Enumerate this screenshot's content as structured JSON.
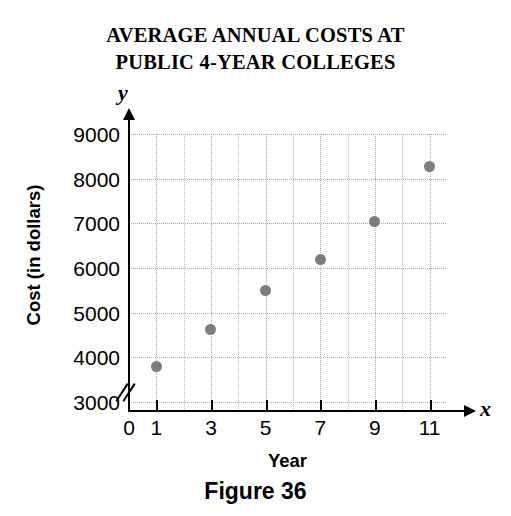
{
  "figure": {
    "title_line_1": "AVERAGE ANNUAL COSTS AT",
    "title_line_2": "PUBLIC 4-YEAR COLLEGES",
    "caption": "Figure 36"
  },
  "axes": {
    "y_variable_letter": "y",
    "x_variable_letter": "x",
    "y_title": "Cost (in dollars)",
    "x_title": "Year",
    "y_tick_labels": [
      "9000",
      "8000",
      "7000",
      "6000",
      "5000",
      "4000",
      "3000"
    ],
    "x_tick_labels": [
      "0",
      "1",
      "3",
      "5",
      "7",
      "9",
      "11"
    ],
    "has_y_axis_break": true
  },
  "colors": {
    "point": "#7d7d7d",
    "grid": "#b9b9b9",
    "axis": "#000000",
    "background": "#ffffff"
  },
  "chart_data": {
    "type": "scatter",
    "title": "AVERAGE ANNUAL COSTS AT PUBLIC 4-YEAR COLLEGES",
    "xlabel": "Year",
    "ylabel": "Cost (in dollars)",
    "x": [
      1,
      3,
      5,
      7,
      9,
      11
    ],
    "values": [
      3800,
      4620,
      5500,
      6180,
      7050,
      8280
    ],
    "series": [
      {
        "name": "Average annual cost",
        "points": [
          {
            "x": 1,
            "y": 3800
          },
          {
            "x": 3,
            "y": 4620
          },
          {
            "x": 5,
            "y": 5500
          },
          {
            "x": 7,
            "y": 6180
          },
          {
            "x": 9,
            "y": 7050
          },
          {
            "x": 11,
            "y": 8280
          }
        ]
      }
    ],
    "xlim": [
      0,
      11.6
    ],
    "ylim": [
      2800,
      9200
    ],
    "xticks": [
      1,
      3,
      5,
      7,
      9,
      11
    ],
    "yticks": [
      3000,
      4000,
      5000,
      6000,
      7000,
      8000,
      9000
    ],
    "x_minor_gridlines": [
      2,
      4,
      6,
      8,
      10
    ],
    "grid": true,
    "legend": "none",
    "y_axis_break": true
  }
}
